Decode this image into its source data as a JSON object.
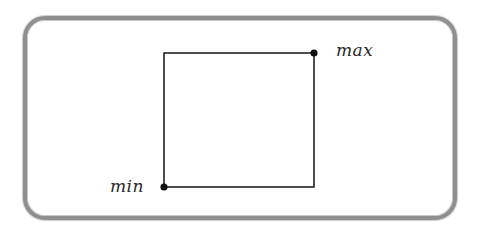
{
  "diagram": {
    "type": "bounding-box",
    "labels": {
      "min": "min",
      "max": "max"
    },
    "rect": {
      "x1": 164,
      "y1": 53,
      "x2": 314,
      "y2": 187
    },
    "points": {
      "min": {
        "x": 164,
        "y": 187
      },
      "max": {
        "x": 314,
        "y": 53
      }
    },
    "colors": {
      "frame_border": "#8f8f8f",
      "stroke": "#222222",
      "background": "#ffffff"
    }
  }
}
